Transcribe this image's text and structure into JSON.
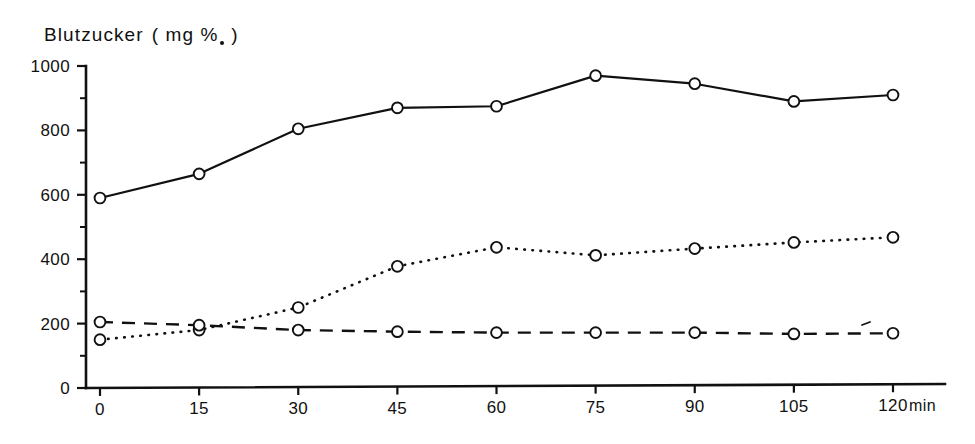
{
  "title": {
    "text": "Blutzucker",
    "unit_open": "(",
    "unit_mg": "mg",
    "unit_percent": "%",
    "unit_close": ")",
    "full": "Blutzucker ( mg %. )"
  },
  "axes": {
    "y_label": "",
    "y_ticks": [
      "0",
      "200",
      "400",
      "600",
      "800",
      "1000"
    ],
    "y_minor_ticks": [
      "100",
      "300",
      "500",
      "700",
      "900"
    ],
    "x_ticks": [
      "0",
      "15",
      "30",
      "45",
      "60",
      "75",
      "90",
      "105",
      "120"
    ],
    "x_unit": "min"
  },
  "colors": {
    "ink": "#111111",
    "background": "#ffffff",
    "marker_fill": "#ffffff"
  },
  "chart_data": {
    "type": "line",
    "xlabel": "min",
    "ylabel": "Blutzucker ( mg % )",
    "xlim": [
      0,
      120
    ],
    "ylim": [
      0,
      1000
    ],
    "grid": false,
    "legend": "none",
    "x": [
      0,
      15,
      30,
      45,
      60,
      75,
      90,
      105,
      120
    ],
    "series": [
      {
        "name": "solid-series",
        "style": "solid",
        "marker": "open-circle",
        "values": [
          590,
          665,
          805,
          870,
          875,
          970,
          945,
          890,
          910
        ]
      },
      {
        "name": "dotted-series",
        "style": "dotted",
        "marker": "open-circle",
        "values": [
          150,
          180,
          250,
          378,
          437,
          412,
          433,
          452,
          468
        ]
      },
      {
        "name": "dashed-series",
        "style": "dashed",
        "marker": "open-circle",
        "values": [
          205,
          195,
          180,
          175,
          172,
          172,
          172,
          168,
          170
        ]
      }
    ]
  },
  "geometry": {
    "plot_left": 100,
    "plot_right": 893,
    "y_top_px": 66,
    "y_bottom_px": 388,
    "y_top_value": 1000,
    "y_bottom_value": 0,
    "axis_x_px": 86,
    "axis_y_px": 388,
    "tick_len_major": 9,
    "tick_len_minor": 6,
    "marker_radius": 5.4
  }
}
